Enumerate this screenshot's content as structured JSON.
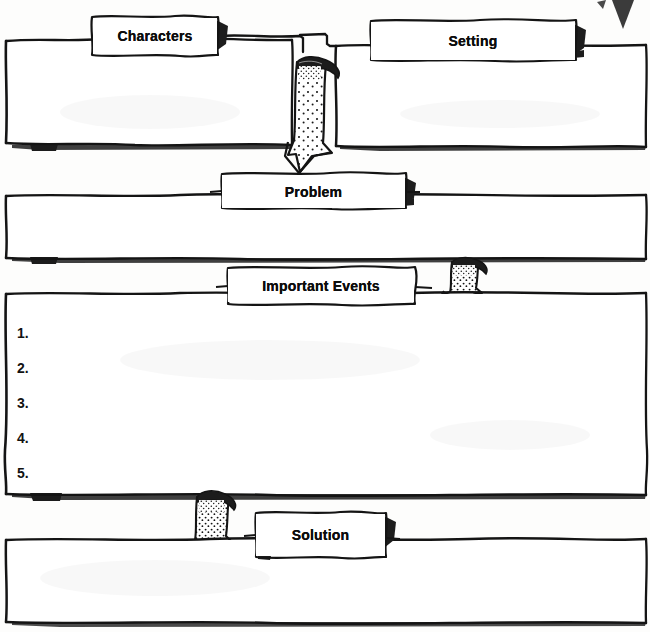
{
  "document": {
    "kind": "story-map-graphic-organizer",
    "title": "Story Map",
    "ink_color": "#111111",
    "paper_color": "#fdfdfc"
  },
  "sections": [
    {
      "id": "characters",
      "label": "Characters"
    },
    {
      "id": "setting",
      "label": "Setting"
    },
    {
      "id": "problem",
      "label": "Problem"
    },
    {
      "id": "events",
      "label": "Important Events"
    },
    {
      "id": "solution",
      "label": "Solution"
    }
  ],
  "labels": {
    "characters": "Characters",
    "setting": "Setting",
    "problem": "Problem",
    "events": "Important Events",
    "solution": "Solution"
  },
  "event_list": {
    "items": [
      "1.",
      "2.",
      "3.",
      "4.",
      "5."
    ]
  },
  "arrows": [
    {
      "id": "arrow-to-problem",
      "from": "characters-setting",
      "to": "problem",
      "direction": "down"
    },
    {
      "id": "arrow-to-events",
      "from": "problem",
      "to": "events",
      "direction": "down"
    },
    {
      "id": "arrow-to-solution",
      "from": "events",
      "to": "solution",
      "direction": "down"
    }
  ]
}
